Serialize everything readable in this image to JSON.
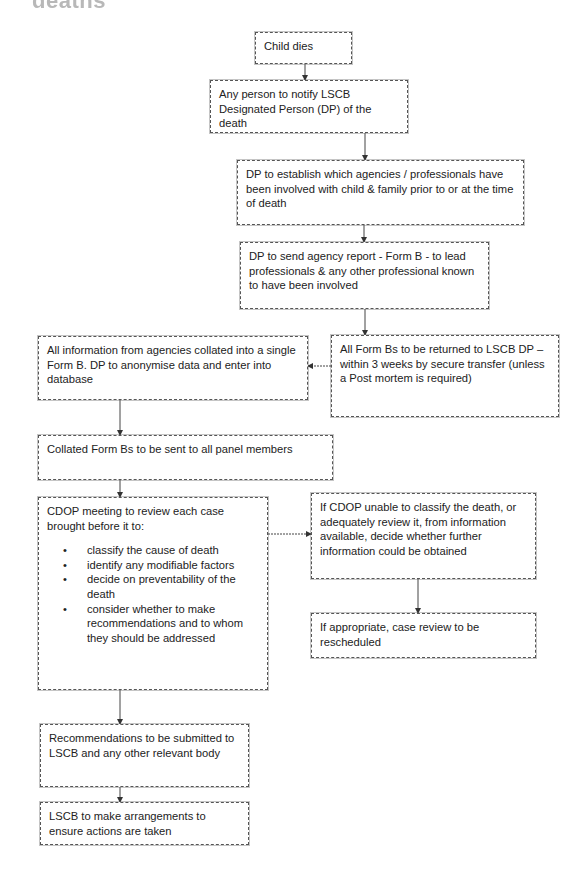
{
  "heading_fragment": "deaths",
  "flowchart": {
    "nodes": [
      {
        "id": "child-dies",
        "text": "Child dies"
      },
      {
        "id": "notify-dp",
        "text": "Any person to notify LSCB Designated Person (DP) of the death"
      },
      {
        "id": "establish-agencies",
        "text": "DP to establish which agencies / professionals have been involved with child & family prior to or at the time of death"
      },
      {
        "id": "send-form-b",
        "text": "DP to send agency report - Form B -  to lead professionals & any other professional known to have been involved"
      },
      {
        "id": "return-form-bs",
        "text": "All Form Bs to be returned to LSCB DP – within 3 weeks by secure transfer (unless a Post mortem is required)"
      },
      {
        "id": "collate-info",
        "text": "All information from agencies collated into a single Form B. DP to anonymise data and enter into database"
      },
      {
        "id": "send-panel",
        "text": "Collated Form Bs to be sent to all panel members"
      },
      {
        "id": "cdop-meeting",
        "text": "CDOP meeting to review each case brought before it to:",
        "bullets": [
          "classify the cause of death",
          "identify any modifiable factors",
          "decide on preventability of the death",
          "consider whether to make recommendations and to whom they should be addressed"
        ]
      },
      {
        "id": "unable-classify",
        "text": "If CDOP unable to classify the death, or adequately review it, from information available, decide whether further information could be obtained"
      },
      {
        "id": "reschedule",
        "text": "If appropriate, case review to be rescheduled"
      },
      {
        "id": "recommendations",
        "text": "Recommendations to be submitted to LSCB and any other relevant body"
      },
      {
        "id": "lscb-actions",
        "text": "LSCB to make arrangements to ensure actions are taken"
      }
    ],
    "edges": [
      {
        "from": "child-dies",
        "to": "notify-dp"
      },
      {
        "from": "notify-dp",
        "to": "establish-agencies"
      },
      {
        "from": "establish-agencies",
        "to": "send-form-b"
      },
      {
        "from": "send-form-b",
        "to": "return-form-bs"
      },
      {
        "from": "return-form-bs",
        "to": "collate-info"
      },
      {
        "from": "collate-info",
        "to": "send-panel"
      },
      {
        "from": "send-panel",
        "to": "cdop-meeting"
      },
      {
        "from": "cdop-meeting",
        "to": "unable-classify"
      },
      {
        "from": "unable-classify",
        "to": "reschedule"
      },
      {
        "from": "cdop-meeting",
        "to": "recommendations"
      },
      {
        "from": "recommendations",
        "to": "lscb-actions"
      }
    ]
  },
  "colors": {
    "border": "#555555",
    "text": "#222222",
    "heading": "#b8b8b8"
  }
}
